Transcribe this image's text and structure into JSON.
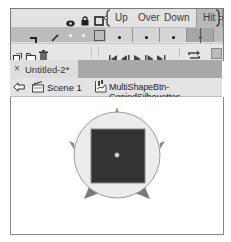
{
  "timeline": {
    "header_icons": [
      "eye-icon",
      "lock-icon",
      "outline-icon"
    ],
    "frame_labels": [
      "Up",
      "Over",
      "Down",
      "Hit"
    ],
    "selected_frame": "Hit",
    "layer": {
      "icons": [
        "layer-icon",
        "pencil-icon"
      ],
      "frames": [
        "keyframe",
        "keyframe",
        "keyframe",
        "keyframe"
      ]
    },
    "toolbar_left": [
      "new-layer-icon",
      "new-folder-icon",
      "trash-icon"
    ],
    "playback": [
      "go-to-first-icon",
      "step-back-icon",
      "play-icon",
      "step-forward-icon",
      "go-to-last-icon",
      "loop-icon",
      "onion-skin-icon"
    ]
  },
  "document_tab": {
    "close_glyph": "×",
    "title": "Untitled-2*"
  },
  "breadcrumb": {
    "back_icon": "back-arrow-icon",
    "scene_label": "Scene 1",
    "symbol_label": "MultiShapeBtn-CopiedSilhouettes"
  },
  "stage": {
    "circle_fill": "#ececec",
    "square_fill": "#333333",
    "spike_fill": "#8a8a8a"
  },
  "colors": {
    "hit_frame_bg": "#b9b9b9",
    "layer_row_bg": "#bcbcbc",
    "tab_bar_bg": "#a8a8a8"
  }
}
